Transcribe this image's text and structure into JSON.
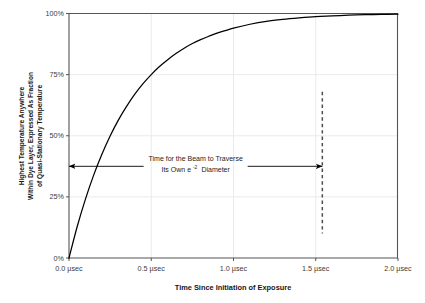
{
  "chart_data": {
    "type": "line",
    "title": "",
    "subtitle": "",
    "xlabel": "Time Since Initiation of Exposure",
    "ylabel_lines": [
      "Highest Temperature Anywhere",
      "Within Dye Layer, Expressed As Fraction",
      "of Quasi-Stationary Temperature"
    ],
    "xlim": [
      0.0,
      2.0
    ],
    "ylim": [
      0,
      100
    ],
    "grid": true,
    "legend": "none",
    "xticks": [
      0.0,
      0.5,
      1.0,
      1.5,
      2.0
    ],
    "xtick_labels": [
      "0.0 µsec",
      "0.5 µsec",
      "1.0 µsec",
      "1.5 µsec",
      "2.0 µsec"
    ],
    "yticks": [
      0,
      25,
      50,
      75,
      100
    ],
    "ytick_labels": [
      "0%",
      "25%",
      "50%",
      "75%",
      "100%"
    ],
    "series": [
      {
        "name": "Highest Temperature Fraction",
        "x": [
          0.0,
          0.05,
          0.1,
          0.15,
          0.2,
          0.25,
          0.3,
          0.35,
          0.4,
          0.45,
          0.5,
          0.55,
          0.6,
          0.65,
          0.7,
          0.75,
          0.8,
          0.85,
          0.9,
          0.95,
          1.0,
          1.1,
          1.2,
          1.3,
          1.4,
          1.5,
          1.6,
          1.7,
          1.8,
          1.9,
          2.0
        ],
        "y": [
          0.0,
          12.9,
          24.1,
          33.9,
          42.4,
          49.9,
          56.4,
          62.0,
          67.0,
          71.3,
          75.0,
          78.3,
          81.1,
          83.6,
          85.8,
          87.7,
          89.3,
          90.7,
          92.0,
          93.0,
          94.0,
          95.6,
          96.8,
          97.6,
          98.2,
          98.7,
          99.0,
          99.3,
          99.5,
          99.6,
          99.7
        ]
      }
    ],
    "annotations": [
      {
        "name": "beam-traverse-annotation",
        "line1": "Time for the Beam to Traverse",
        "line2_pre": "Its Own e",
        "line2_sup": "-2",
        "line2_post": "Diameter",
        "arrow_from_x": 0.0,
        "arrow_to_x": 1.54,
        "arrow_y_pct": 37.5
      },
      {
        "name": "traverse-time-marker",
        "kind": "vertical-dashed-line",
        "x": 1.54,
        "y_from_pct": 10.0,
        "y_to_pct": 68.0
      }
    ],
    "colors": {
      "curve": "#000000",
      "axis": "#555555",
      "grid": "#e8e8e8",
      "dashed_marker": "#4d4d4d",
      "arrow": "#000000",
      "background": "#ffffff"
    }
  }
}
